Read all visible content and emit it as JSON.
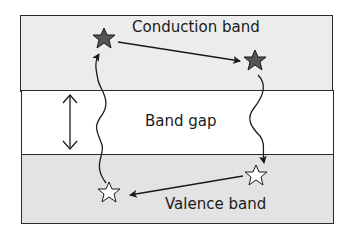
{
  "diagram": {
    "conduction_band_label": "Conduction band",
    "band_gap_label": "Band gap",
    "valence_band_label": "Valence band",
    "colors": {
      "conduction_band_fill": "#ececec",
      "band_gap_fill": "#ffffff",
      "valence_band_fill": "#e3e3e3",
      "electron_star": "#555555",
      "hole_star": "#ffffff",
      "line": "#1a1a1a"
    },
    "elements": [
      "electron-star-left",
      "electron-star-right",
      "hole-star-left",
      "hole-star-right",
      "band-gap-double-arrow",
      "excitation-wavy-arrow",
      "recombination-wavy-arrow",
      "electron-drift-arrow",
      "hole-drift-arrow"
    ]
  }
}
